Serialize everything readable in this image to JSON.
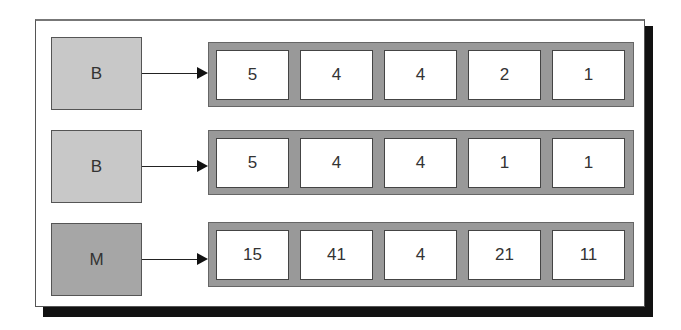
{
  "diagram": {
    "rows": [
      {
        "label": "B",
        "shade": "light",
        "values": [
          "5",
          "4",
          "4",
          "2",
          "1"
        ]
      },
      {
        "label": "B",
        "shade": "light",
        "values": [
          "5",
          "4",
          "4",
          "1",
          "1"
        ]
      },
      {
        "label": "M",
        "shade": "dark",
        "values": [
          "15",
          "41",
          "4",
          "21",
          "11"
        ]
      }
    ]
  },
  "colors": {
    "label_light": "#c8c8c8",
    "label_dark": "#a6a6a6",
    "row_container": "#999999",
    "cell": "#ffffff",
    "frame_shadow": "#111111"
  }
}
